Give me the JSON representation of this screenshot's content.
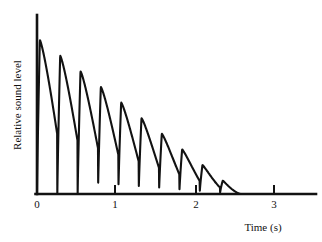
{
  "chart_data": {
    "type": "line",
    "title": "",
    "subtitle": "",
    "xlabel": "Time (s)",
    "ylabel": "Relative sound level",
    "xlim": [
      0,
      3.5
    ],
    "ylim": [
      0,
      1.05
    ],
    "grid": false,
    "legend": null,
    "xticks": [
      0,
      1,
      2,
      3
    ],
    "xtick_labels": [
      "0",
      "1",
      "2",
      "3"
    ],
    "yticks": [],
    "ytick_labels": [],
    "series": [
      {
        "name": "Relative sound level",
        "color": "#121212",
        "period_s": 0.255,
        "decay_end_s": 2.55,
        "initial_amplitude": 1.0,
        "peaks": [
          {
            "t": 0.02,
            "y": 1.0
          },
          {
            "t": 0.27,
            "y": 0.9
          },
          {
            "t": 0.52,
            "y": 0.8
          },
          {
            "t": 0.78,
            "y": 0.7
          },
          {
            "t": 1.03,
            "y": 0.6
          },
          {
            "t": 1.29,
            "y": 0.5
          },
          {
            "t": 1.54,
            "y": 0.4
          },
          {
            "t": 1.8,
            "y": 0.31
          },
          {
            "t": 2.05,
            "y": 0.22
          },
          {
            "t": 2.31,
            "y": 0.13
          },
          {
            "t": 2.5,
            "y": 0.12
          }
        ],
        "troughs": [
          {
            "t": 0.18,
            "y": 0.56
          },
          {
            "t": 0.43,
            "y": 0.49
          },
          {
            "t": 0.69,
            "y": 0.43
          },
          {
            "t": 0.94,
            "y": 0.37
          },
          {
            "t": 1.2,
            "y": 0.31
          },
          {
            "t": 1.45,
            "y": 0.25
          },
          {
            "t": 1.71,
            "y": 0.19
          },
          {
            "t": 1.96,
            "y": 0.13
          },
          {
            "t": 2.22,
            "y": 0.06
          },
          {
            "t": 2.36,
            "y": 0.0
          }
        ]
      }
    ]
  },
  "axes": {
    "x_axis_label": "Time (s)",
    "y_axis_label": "Relative sound level",
    "x_tick_labels": [
      "0",
      "1",
      "2",
      "3"
    ]
  },
  "colors": {
    "ink": "#121212",
    "background": "#ffffff"
  }
}
